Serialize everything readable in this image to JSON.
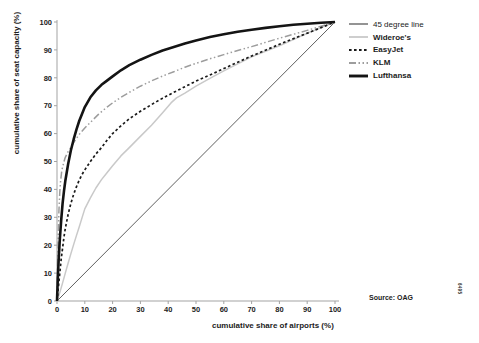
{
  "figure": {
    "source_note": "Source: OAG",
    "edge_code": "6495"
  },
  "chart_data": {
    "type": "line",
    "title": "",
    "xlabel": "cumulative share of airports (%)",
    "ylabel": "cumulative share of seat capacity (%)",
    "xlim": [
      0,
      100
    ],
    "ylim": [
      0,
      100
    ],
    "x_ticks": [
      0,
      10,
      20,
      30,
      40,
      50,
      60,
      70,
      80,
      90,
      100
    ],
    "y_ticks": [
      0,
      10,
      20,
      30,
      40,
      50,
      60,
      70,
      80,
      90,
      100
    ],
    "grid": false,
    "legend_position": "top-right-outside",
    "axis_color": "#a3a3a3",
    "text_color": "#1c1c1c",
    "draw_order": [
      0,
      1,
      3,
      2,
      4
    ],
    "series": [
      {
        "name": "45 degree line",
        "color": "#4d4d4d",
        "width": 0.9,
        "dash": "",
        "bold_label": false,
        "points": [
          [
            0,
            0
          ],
          [
            100,
            100
          ]
        ]
      },
      {
        "name": "Wideroe's",
        "color": "#c9c9c9",
        "width": 1.5,
        "dash": "",
        "bold_label": true,
        "points": [
          [
            0,
            0
          ],
          [
            1,
            3
          ],
          [
            2,
            6.5
          ],
          [
            3,
            10
          ],
          [
            4,
            13.5
          ],
          [
            5,
            17
          ],
          [
            6,
            20.3
          ],
          [
            7,
            23.5
          ],
          [
            8,
            26.5
          ],
          [
            9,
            29.8
          ],
          [
            10,
            33
          ],
          [
            12,
            37
          ],
          [
            14,
            40.5
          ],
          [
            16,
            43.5
          ],
          [
            18,
            46
          ],
          [
            20,
            48.5
          ],
          [
            23,
            52
          ],
          [
            26,
            55
          ],
          [
            30,
            59
          ],
          [
            34,
            63
          ],
          [
            38,
            67.5
          ],
          [
            41,
            71
          ],
          [
            43,
            72.8
          ],
          [
            46,
            74.5
          ],
          [
            50,
            77
          ],
          [
            55,
            79.8
          ],
          [
            60,
            82.5
          ],
          [
            65,
            85
          ],
          [
            70,
            87.5
          ],
          [
            75,
            89.5
          ],
          [
            80,
            91.5
          ],
          [
            85,
            93.7
          ],
          [
            90,
            96
          ],
          [
            95,
            98
          ],
          [
            100,
            100
          ]
        ]
      },
      {
        "name": "EasyJet",
        "color": "#1a1a1a",
        "width": 1.7,
        "dash": "2.6,2.4",
        "bold_label": true,
        "points": [
          [
            0,
            0
          ],
          [
            0.5,
            5
          ],
          [
            1,
            10
          ],
          [
            1.5,
            15
          ],
          [
            2,
            19
          ],
          [
            2.5,
            23
          ],
          [
            3,
            26
          ],
          [
            4,
            31
          ],
          [
            5,
            35
          ],
          [
            6,
            38.3
          ],
          [
            7,
            41
          ],
          [
            8,
            43.3
          ],
          [
            9,
            45.3
          ],
          [
            10,
            47
          ],
          [
            12,
            50
          ],
          [
            14,
            52.7
          ],
          [
            16,
            55
          ],
          [
            18,
            57.6
          ],
          [
            20,
            60
          ],
          [
            23,
            62.8
          ],
          [
            26,
            65.3
          ],
          [
            30,
            68
          ],
          [
            34,
            70.4
          ],
          [
            38,
            72.7
          ],
          [
            42,
            74.8
          ],
          [
            46,
            76.8
          ],
          [
            50,
            78.8
          ],
          [
            55,
            81
          ],
          [
            60,
            83.3
          ],
          [
            65,
            85.6
          ],
          [
            70,
            87.8
          ],
          [
            75,
            89.9
          ],
          [
            80,
            92
          ],
          [
            85,
            94
          ],
          [
            90,
            96
          ],
          [
            95,
            98
          ],
          [
            100,
            100
          ]
        ]
      },
      {
        "name": "KLM",
        "color": "#9d9d9d",
        "width": 1.5,
        "dash": "7,2.5,1.5,2.5,1.5,2.5",
        "bold_label": true,
        "points": [
          [
            0,
            0
          ],
          [
            0.2,
            12
          ],
          [
            0.4,
            22
          ],
          [
            0.7,
            32
          ],
          [
            1,
            39
          ],
          [
            1.3,
            43
          ],
          [
            1.7,
            46.5
          ],
          [
            2,
            48
          ],
          [
            2.5,
            50
          ],
          [
            3,
            51.5
          ],
          [
            4,
            53.5
          ],
          [
            5,
            55
          ],
          [
            6,
            56.8
          ],
          [
            7,
            58.3
          ],
          [
            8,
            59.7
          ],
          [
            10,
            62
          ],
          [
            12,
            64
          ],
          [
            15,
            67
          ],
          [
            18,
            69.5
          ],
          [
            20,
            71
          ],
          [
            23,
            73
          ],
          [
            26,
            74.8
          ],
          [
            30,
            77
          ],
          [
            34,
            78.9
          ],
          [
            38,
            80.6
          ],
          [
            42,
            82.2
          ],
          [
            46,
            83.8
          ],
          [
            50,
            85.2
          ],
          [
            55,
            86.8
          ],
          [
            60,
            88.3
          ],
          [
            65,
            89.8
          ],
          [
            70,
            91.2
          ],
          [
            75,
            92.7
          ],
          [
            80,
            94.2
          ],
          [
            85,
            95.6
          ],
          [
            90,
            97
          ],
          [
            95,
            98.5
          ],
          [
            100,
            100
          ]
        ]
      },
      {
        "name": "Lufthansa",
        "color": "#141414",
        "width": 2.6,
        "dash": "",
        "bold_label": true,
        "points": [
          [
            0,
            0
          ],
          [
            0.3,
            8
          ],
          [
            0.6,
            15
          ],
          [
            1,
            22
          ],
          [
            1.5,
            29
          ],
          [
            2,
            35
          ],
          [
            2.5,
            39.5
          ],
          [
            3,
            43
          ],
          [
            4,
            49
          ],
          [
            5,
            54
          ],
          [
            6,
            58
          ],
          [
            7,
            61.5
          ],
          [
            8,
            64.5
          ],
          [
            9,
            67
          ],
          [
            10,
            69.5
          ],
          [
            12,
            73
          ],
          [
            14,
            75.5
          ],
          [
            16,
            77.5
          ],
          [
            18,
            79
          ],
          [
            20,
            80.5
          ],
          [
            23,
            82.7
          ],
          [
            26,
            84.5
          ],
          [
            30,
            86.5
          ],
          [
            34,
            88.2
          ],
          [
            38,
            89.8
          ],
          [
            42,
            91
          ],
          [
            46,
            92.3
          ],
          [
            50,
            93.4
          ],
          [
            55,
            94.6
          ],
          [
            60,
            95.6
          ],
          [
            65,
            96.5
          ],
          [
            70,
            97.2
          ],
          [
            75,
            97.9
          ],
          [
            80,
            98.5
          ],
          [
            85,
            99
          ],
          [
            90,
            99.4
          ],
          [
            95,
            99.7
          ],
          [
            100,
            100
          ]
        ]
      }
    ]
  }
}
